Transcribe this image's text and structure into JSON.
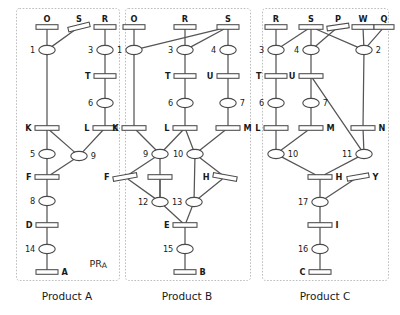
{
  "figure": {
    "kind": "petri-net-diagram",
    "panels": [
      {
        "id": "A",
        "caption": "Product A",
        "annotation": {
          "main": "PR",
          "sub": "A"
        },
        "box": {
          "x": 16,
          "y": 8,
          "w": 103,
          "h": 272
        },
        "transitions": [
          {
            "id": "A-O",
            "label": "O",
            "x": 47,
            "y": 27,
            "w": 22,
            "label_pos": "top"
          },
          {
            "id": "A-S",
            "label": "S",
            "x": 79,
            "y": 27,
            "w": 22,
            "label_pos": "top",
            "tilt": -14
          },
          {
            "id": "A-R",
            "label": "R",
            "x": 105,
            "y": 27,
            "w": 22,
            "label_pos": "top"
          },
          {
            "id": "A-T",
            "label": "T",
            "x": 105,
            "y": 76,
            "w": 22,
            "label_pos": "left"
          },
          {
            "id": "A-K",
            "label": "K",
            "x": 47,
            "y": 128,
            "w": 24,
            "label_pos": "left"
          },
          {
            "id": "A-L",
            "label": "L",
            "x": 105,
            "y": 128,
            "w": 24,
            "label_pos": "left"
          },
          {
            "id": "A-F",
            "label": "F",
            "x": 47,
            "y": 177,
            "w": 24,
            "label_pos": "left"
          },
          {
            "id": "A-D",
            "label": "D",
            "x": 47,
            "y": 225,
            "w": 22,
            "label_pos": "left"
          },
          {
            "id": "A-A",
            "label": "A",
            "x": 47,
            "y": 272,
            "w": 22,
            "label_pos": "right"
          }
        ],
        "places": [
          {
            "id": "A-1",
            "label": "1",
            "x": 47,
            "y": 50,
            "label_pos": "left"
          },
          {
            "id": "A-3",
            "label": "3",
            "x": 105,
            "y": 50,
            "label_pos": "left"
          },
          {
            "id": "A-6",
            "label": "6",
            "x": 105,
            "y": 103,
            "label_pos": "left"
          },
          {
            "id": "A-5",
            "label": "5",
            "x": 47,
            "y": 154,
            "label_pos": "left"
          },
          {
            "id": "A-9",
            "label": "9",
            "x": 79,
            "y": 156,
            "label_pos": "right"
          },
          {
            "id": "A-8",
            "label": "8",
            "x": 47,
            "y": 201,
            "label_pos": "left"
          },
          {
            "id": "A-14",
            "label": "14",
            "x": 47,
            "y": 249,
            "label_pos": "left"
          }
        ],
        "arcs": [
          [
            "A-O",
            "A-1"
          ],
          [
            "A-S",
            "A-1"
          ],
          [
            "A-R",
            "A-3"
          ],
          [
            "A-1",
            "A-K"
          ],
          [
            "A-3",
            "A-T"
          ],
          [
            "A-T",
            "A-6"
          ],
          [
            "A-6",
            "A-L"
          ],
          [
            "A-K",
            "A-5"
          ],
          [
            "A-K",
            "A-9"
          ],
          [
            "A-L",
            "A-9"
          ],
          [
            "A-5",
            "A-F"
          ],
          [
            "A-9",
            "A-F"
          ],
          [
            "A-F",
            "A-8"
          ],
          [
            "A-8",
            "A-D"
          ],
          [
            "A-D",
            "A-14"
          ],
          [
            "A-14",
            "A-A"
          ]
        ]
      },
      {
        "id": "B",
        "caption": "Product B",
        "box": {
          "x": 125,
          "y": 8,
          "w": 125,
          "h": 272
        },
        "transitions": [
          {
            "id": "B-O",
            "label": "O",
            "x": 134,
            "y": 27,
            "w": 22,
            "label_pos": "top"
          },
          {
            "id": "B-R",
            "label": "R",
            "x": 185,
            "y": 27,
            "w": 22,
            "label_pos": "top"
          },
          {
            "id": "B-S",
            "label": "S",
            "x": 228,
            "y": 27,
            "w": 22,
            "label_pos": "top"
          },
          {
            "id": "B-T",
            "label": "T",
            "x": 185,
            "y": 76,
            "w": 22,
            "label_pos": "left"
          },
          {
            "id": "B-U",
            "label": "U",
            "x": 228,
            "y": 76,
            "w": 22,
            "label_pos": "left"
          },
          {
            "id": "B-K",
            "label": "K",
            "x": 134,
            "y": 128,
            "w": 24,
            "label_pos": "left"
          },
          {
            "id": "B-L",
            "label": "L",
            "x": 185,
            "y": 128,
            "w": 24,
            "label_pos": "left"
          },
          {
            "id": "B-M",
            "label": "M",
            "x": 228,
            "y": 128,
            "w": 24,
            "label_pos": "right"
          },
          {
            "id": "B-F",
            "label": "F",
            "x": 125,
            "y": 177,
            "w": 24,
            "label_pos": "left",
            "tilt": -10
          },
          {
            "id": "B-G",
            "label": "",
            "x": 160,
            "y": 177,
            "w": 24,
            "label_pos": "none"
          },
          {
            "id": "B-H",
            "label": "H",
            "x": 225,
            "y": 177,
            "w": 24,
            "label_pos": "left",
            "tilt": 10
          },
          {
            "id": "B-E",
            "label": "E",
            "x": 185,
            "y": 225,
            "w": 24,
            "label_pos": "left"
          },
          {
            "id": "B-B",
            "label": "B",
            "x": 185,
            "y": 272,
            "w": 22,
            "label_pos": "right"
          }
        ],
        "places": [
          {
            "id": "B-1",
            "label": "1",
            "x": 134,
            "y": 50,
            "label_pos": "left"
          },
          {
            "id": "B-3",
            "label": "3",
            "x": 185,
            "y": 50,
            "label_pos": "left"
          },
          {
            "id": "B-4",
            "label": "4",
            "x": 228,
            "y": 50,
            "label_pos": "left"
          },
          {
            "id": "B-6",
            "label": "6",
            "x": 185,
            "y": 103,
            "label_pos": "left"
          },
          {
            "id": "B-7",
            "label": "7",
            "x": 228,
            "y": 103,
            "label_pos": "right"
          },
          {
            "id": "B-9",
            "label": "9",
            "x": 160,
            "y": 154,
            "label_pos": "left"
          },
          {
            "id": "B-10",
            "label": "10",
            "x": 195,
            "y": 154,
            "label_pos": "left"
          },
          {
            "id": "B-12",
            "label": "12",
            "x": 160,
            "y": 202,
            "label_pos": "left"
          },
          {
            "id": "B-13",
            "label": "13",
            "x": 194,
            "y": 202,
            "label_pos": "left"
          },
          {
            "id": "B-15",
            "label": "15",
            "x": 185,
            "y": 249,
            "label_pos": "left"
          }
        ],
        "arcs": [
          [
            "B-O",
            "B-1"
          ],
          [
            "B-R",
            "B-3"
          ],
          [
            "B-S",
            "B-4"
          ],
          [
            "B-S",
            "B-1"
          ],
          [
            "B-S",
            "B-3"
          ],
          [
            "B-1",
            "B-K"
          ],
          [
            "B-3",
            "B-T"
          ],
          [
            "B-T",
            "B-6"
          ],
          [
            "B-6",
            "B-L"
          ],
          [
            "B-4",
            "B-U"
          ],
          [
            "B-U",
            "B-7"
          ],
          [
            "B-7",
            "B-M"
          ],
          [
            "B-K",
            "B-9"
          ],
          [
            "B-L",
            "B-9"
          ],
          [
            "B-L",
            "B-10"
          ],
          [
            "B-M",
            "B-10"
          ],
          [
            "B-9",
            "B-F"
          ],
          [
            "B-9",
            "B-12"
          ],
          [
            "B-10",
            "B-13"
          ],
          [
            "B-10",
            "B-H"
          ],
          [
            "B-G",
            "B-12"
          ],
          [
            "B-F",
            "B-12"
          ],
          [
            "B-H",
            "B-13"
          ],
          [
            "B-12",
            "B-E"
          ],
          [
            "B-13",
            "B-E"
          ],
          [
            "B-E",
            "B-15"
          ],
          [
            "B-15",
            "B-B"
          ]
        ]
      },
      {
        "id": "C",
        "caption": "Product C",
        "box": {
          "x": 262,
          "y": 8,
          "w": 126,
          "h": 272
        },
        "transitions": [
          {
            "id": "C-R",
            "label": "R",
            "x": 276,
            "y": 27,
            "w": 22,
            "label_pos": "top"
          },
          {
            "id": "C-S",
            "label": "S",
            "x": 311,
            "y": 27,
            "w": 24,
            "label_pos": "top"
          },
          {
            "id": "C-P",
            "label": "P",
            "x": 338,
            "y": 27,
            "w": 22,
            "label_pos": "top",
            "tilt": -8
          },
          {
            "id": "C-W",
            "label": "W",
            "x": 363,
            "y": 27,
            "w": 22,
            "label_pos": "top"
          },
          {
            "id": "C-Q",
            "label": "Q",
            "x": 384,
            "y": 27,
            "w": 20,
            "label_pos": "top"
          },
          {
            "id": "C-T",
            "label": "T",
            "x": 276,
            "y": 76,
            "w": 22,
            "label_pos": "left"
          },
          {
            "id": "C-U",
            "label": "U",
            "x": 311,
            "y": 76,
            "w": 24,
            "label_pos": "left"
          },
          {
            "id": "C-L",
            "label": "L",
            "x": 276,
            "y": 128,
            "w": 24,
            "label_pos": "left"
          },
          {
            "id": "C-M",
            "label": "M",
            "x": 311,
            "y": 128,
            "w": 24,
            "label_pos": "right"
          },
          {
            "id": "C-N",
            "label": "N",
            "x": 363,
            "y": 128,
            "w": 24,
            "label_pos": "right"
          },
          {
            "id": "C-H",
            "label": "H",
            "x": 320,
            "y": 177,
            "w": 24,
            "label_pos": "right"
          },
          {
            "id": "C-Y",
            "label": "Y",
            "x": 358,
            "y": 177,
            "w": 22,
            "label_pos": "right",
            "tilt": -10
          },
          {
            "id": "C-I",
            "label": "I",
            "x": 320,
            "y": 225,
            "w": 24,
            "label_pos": "right"
          },
          {
            "id": "C-C",
            "label": "C",
            "x": 320,
            "y": 272,
            "w": 22,
            "label_pos": "left"
          }
        ],
        "places": [
          {
            "id": "C-3",
            "label": "3",
            "x": 276,
            "y": 50,
            "label_pos": "left"
          },
          {
            "id": "C-4",
            "label": "4",
            "x": 311,
            "y": 50,
            "label_pos": "left"
          },
          {
            "id": "C-2",
            "label": "2",
            "x": 364,
            "y": 50,
            "label_pos": "right"
          },
          {
            "id": "C-6",
            "label": "6",
            "x": 276,
            "y": 103,
            "label_pos": "left"
          },
          {
            "id": "C-7",
            "label": "7",
            "x": 311,
            "y": 103,
            "label_pos": "right"
          },
          {
            "id": "C-10",
            "label": "10",
            "x": 276,
            "y": 154,
            "label_pos": "right"
          },
          {
            "id": "C-11",
            "label": "11",
            "x": 364,
            "y": 154,
            "label_pos": "left"
          },
          {
            "id": "C-17",
            "label": "17",
            "x": 320,
            "y": 202,
            "label_pos": "left"
          },
          {
            "id": "C-16",
            "label": "16",
            "x": 320,
            "y": 249,
            "label_pos": "left"
          }
        ],
        "arcs": [
          [
            "C-R",
            "C-3"
          ],
          [
            "C-S",
            "C-3"
          ],
          [
            "C-S",
            "C-4"
          ],
          [
            "C-S",
            "C-2"
          ],
          [
            "C-P",
            "C-4"
          ],
          [
            "C-W",
            "C-2"
          ],
          [
            "C-Q",
            "C-2"
          ],
          [
            "C-3",
            "C-T"
          ],
          [
            "C-T",
            "C-6"
          ],
          [
            "C-6",
            "C-L"
          ],
          [
            "C-4",
            "C-U"
          ],
          [
            "C-U",
            "C-7"
          ],
          [
            "C-7",
            "C-M"
          ],
          [
            "C-U",
            "C-11"
          ],
          [
            "C-2",
            "C-N"
          ],
          [
            "C-N",
            "C-11"
          ],
          [
            "C-L",
            "C-10"
          ],
          [
            "C-M",
            "C-10"
          ],
          [
            "C-10",
            "C-H"
          ],
          [
            "C-11",
            "C-H"
          ],
          [
            "C-H",
            "C-17"
          ],
          [
            "C-Y",
            "C-17"
          ],
          [
            "C-17",
            "C-I"
          ],
          [
            "C-I",
            "C-16"
          ],
          [
            "C-16",
            "C-C"
          ]
        ]
      }
    ],
    "captions": [
      {
        "id": "cap-a",
        "text": "Product A",
        "x": 67,
        "y": 300
      },
      {
        "id": "cap-b",
        "text": "Product B",
        "x": 187,
        "y": 300
      },
      {
        "id": "cap-c",
        "text": "Product C",
        "x": 325,
        "y": 300
      }
    ],
    "colors": {
      "background": "#ffffff",
      "stroke": "#4a4a4a",
      "arc": "#555555",
      "panel_border": "#bdbdbd",
      "text": "#1a1a1a"
    }
  }
}
